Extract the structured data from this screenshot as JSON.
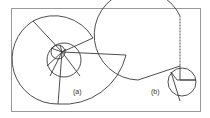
{
  "figure": {
    "panels": [
      {
        "id": "a",
        "label": "(a)",
        "description": "spiral of circular sectors with nested inner circles"
      },
      {
        "id": "b",
        "label": "(b)",
        "description": "large sector with small circle subdivided into sectors"
      }
    ],
    "colors": {
      "stroke": "#3a3a3a",
      "frame": "#9a9a9a",
      "background": "#ffffff"
    }
  }
}
